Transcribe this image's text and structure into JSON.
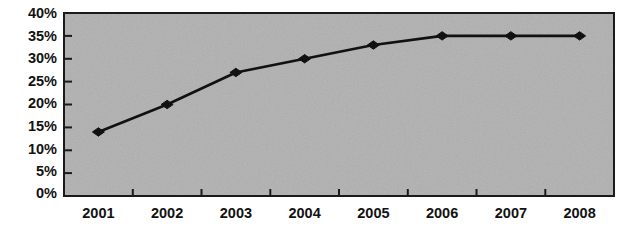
{
  "chart_data": {
    "type": "line",
    "title": "",
    "subtitle": "",
    "xlabel": "",
    "ylabel": "",
    "categories": [
      "2001",
      "2002",
      "2003",
      "2004",
      "2005",
      "2006",
      "2007",
      "2008"
    ],
    "values": [
      14,
      20,
      27,
      30,
      33,
      35,
      35,
      35
    ],
    "series": [
      {
        "name": "",
        "values": [
          14,
          20,
          27,
          30,
          33,
          35,
          35,
          35
        ]
      }
    ],
    "ylim": [
      0,
      40
    ],
    "ytick_values": [
      0,
      5,
      10,
      15,
      20,
      25,
      30,
      35,
      40
    ],
    "ytick_labels": [
      "0%",
      "5%",
      "10%",
      "15%",
      "20%",
      "25%",
      "30%",
      "35%",
      "40%"
    ],
    "xtick_labels": [
      "2001",
      "2002",
      "2003",
      "2004",
      "2005",
      "2006",
      "2007",
      "2008"
    ],
    "grid": false,
    "legend": false,
    "legend_position": "none",
    "marker": "diamond",
    "annotations": [],
    "colors": {
      "line": "#111111",
      "marker": "#111111",
      "plot_background": "#c9c9c9",
      "page_background": "#ffffff",
      "axis": "#1a1a1a",
      "text": "#121212"
    }
  },
  "layout": {
    "plot_left": 64,
    "plot_top": 13,
    "plot_right": 614,
    "plot_bottom": 196
  }
}
